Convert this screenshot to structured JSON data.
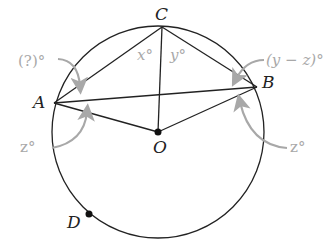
{
  "diagram": {
    "points": {
      "A": {
        "label": "A"
      },
      "B": {
        "label": "B"
      },
      "C": {
        "label": "C"
      },
      "O": {
        "label": "O"
      },
      "D": {
        "label": "D"
      }
    },
    "angles": {
      "x": "x°",
      "y": "y°",
      "unknown": "(?)°",
      "y_minus_z": "(y − z)°",
      "z_left": "z°",
      "z_right": "z°"
    },
    "colors": {
      "line": "#222222",
      "annotation": "#a8a8a8",
      "background": "#ffffff"
    }
  }
}
